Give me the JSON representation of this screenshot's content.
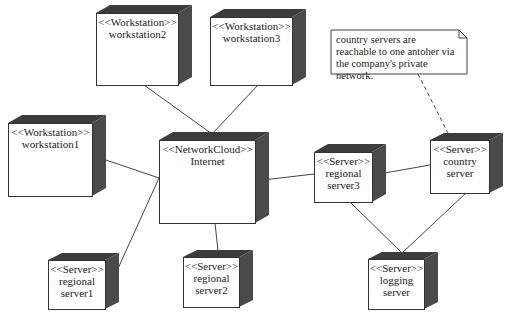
{
  "diagram": {
    "type": "UML deployment diagram",
    "colors": {
      "box_fill": "#ffffff",
      "box_side": "#4a4a4a",
      "box_top": "#3a3a3a",
      "line": "#444444"
    },
    "nodes": [
      {
        "id": "workstation2",
        "stereotype": "<<Workstation>>",
        "name": "workstation2"
      },
      {
        "id": "workstation3",
        "stereotype": "<<Workstation>>",
        "name": "workstation3"
      },
      {
        "id": "workstation1",
        "stereotype": "<<Workstation>>",
        "name": "workstation1"
      },
      {
        "id": "internet",
        "stereotype": "<<NetworkCloud>>",
        "name": "Internet"
      },
      {
        "id": "regional_server3",
        "stereotype": "<<Server>>",
        "name": "regional\nserver3"
      },
      {
        "id": "country_server",
        "stereotype": "<<Server>>",
        "name": "country\nserver"
      },
      {
        "id": "regional_server1",
        "stereotype": "<<Server>>",
        "name": "regional\nserver1"
      },
      {
        "id": "regional_server2",
        "stereotype": "<<Server>>",
        "name": "regional\nserver2"
      },
      {
        "id": "logging_server",
        "stereotype": "<<Server>>",
        "name": "logging\nserver"
      }
    ],
    "note": {
      "text": "country servers are reachable to one antoher via the company's private network."
    },
    "edges": [
      {
        "from": "workstation2",
        "to": "internet"
      },
      {
        "from": "workstation3",
        "to": "internet"
      },
      {
        "from": "workstation1",
        "to": "internet"
      },
      {
        "from": "regional_server1",
        "to": "internet"
      },
      {
        "from": "regional_server2",
        "to": "internet"
      },
      {
        "from": "internet",
        "to": "regional_server3"
      },
      {
        "from": "regional_server3",
        "to": "country_server"
      },
      {
        "from": "regional_server3",
        "to": "logging_server"
      },
      {
        "from": "country_server",
        "to": "logging_server"
      },
      {
        "from": "note",
        "to": "country_server",
        "style": "dashed"
      }
    ]
  }
}
